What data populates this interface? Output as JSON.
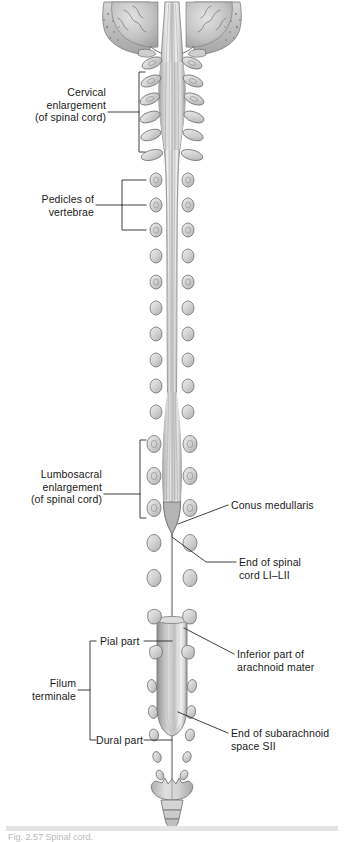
{
  "figure": {
    "view": "posterior view, vertebral arches removed",
    "style": "grayscale anatomical illustration"
  },
  "labels": {
    "cervical_enlargement": {
      "lines": [
        "Cervical",
        "enlargement",
        "(of spinal cord)"
      ],
      "text": "Cervical enlargement (of spinal cord)",
      "side": "left"
    },
    "pedicles": {
      "lines": [
        "Pedicles of",
        "vertebrae"
      ],
      "text": "Pedicles of vertebrae",
      "side": "left"
    },
    "lumbosacral_enlargement": {
      "lines": [
        "Lumbosacral",
        "enlargement",
        "(of spinal cord)"
      ],
      "text": "Lumbosacral enlargement (of spinal cord)",
      "side": "left"
    },
    "conus_medullaris": {
      "lines": [
        "Conus medullaris"
      ],
      "text": "Conus medullaris",
      "side": "right"
    },
    "end_of_spinal_cord": {
      "lines": [
        "End of spinal",
        "cord LI–LII"
      ],
      "text": "End of spinal cord LI–LII",
      "side": "right"
    },
    "inferior_arachnoid": {
      "lines": [
        "Inferior part of",
        "arachnoid mater"
      ],
      "text": "Inferior part of arachnoid mater",
      "side": "right"
    },
    "end_of_subarachnoid_space": {
      "lines": [
        "End of subarachnoid",
        "space SII"
      ],
      "text": "End of subarachnoid space SII",
      "side": "right"
    },
    "filum_terminale": {
      "lines": [
        "Filum",
        "terminale"
      ],
      "text": "Filum terminale",
      "side": "left"
    },
    "pial_part": {
      "lines": [
        "Pial part"
      ],
      "text": "Pial part",
      "side": "left"
    },
    "dural_part": {
      "lines": [
        "Dural part"
      ],
      "text": "Dural part",
      "side": "left"
    }
  },
  "caption": {
    "text": "Fig. 2.57 Spinal cord."
  },
  "colors": {
    "ink": "#1a1a1a",
    "leader": "#3a3a3a",
    "bone_light": "#e8e8e8",
    "bone_mid": "#c9c9c9",
    "bone_dark": "#9a9a9a",
    "cord_light": "#ededed",
    "cord_mid": "#c4c4c4",
    "cord_dark": "#8e8e8e",
    "dura_mid": "#b5b5b5",
    "outline": "#6e6e6e",
    "page": "#ffffff"
  }
}
